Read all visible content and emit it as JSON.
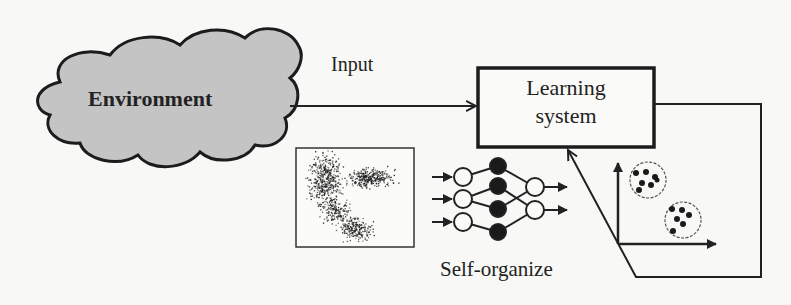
{
  "diagram": {
    "nodes": {
      "environment": {
        "label": "Environment",
        "shape": "cloud",
        "fill": "#c4c4c4"
      },
      "learning_system": {
        "label_line1": "Learning",
        "label_line2": "system",
        "shape": "rectangle"
      }
    },
    "edges": {
      "input": {
        "label": "Input",
        "from": "environment",
        "to": "learning_system"
      },
      "feedback": {
        "label": "",
        "from": "learning_system",
        "to": "learning_system",
        "via": "clustered-output-plot"
      }
    },
    "annotations": {
      "self_organize": "Self-organize"
    },
    "illustrations": {
      "scatter": "unlabeled-data-scatter",
      "network": {
        "inputs": 3,
        "hidden": 4,
        "outputs": 2
      },
      "clusters": {
        "count": 2,
        "points_per_cluster": 6
      }
    },
    "colors": {
      "stroke": "#222222",
      "cloud_fill": "#c4c4c4",
      "background": "#f8f8f6"
    }
  }
}
